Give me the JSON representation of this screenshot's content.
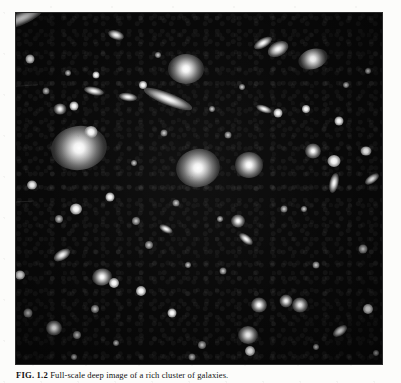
{
  "page": {
    "background_color": "#fcfcfa"
  },
  "figure": {
    "plate_background_color": "#090909",
    "alt_description": "Deep-field astronomical photograph of a rich cluster of galaxies against a black sky, showing numerous elliptical and spiral galaxies of varying brightness.",
    "caption": {
      "label": "FIG. 1.2",
      "separator": "  ",
      "text": "Full-scale deep image of a rich cluster of galaxies."
    }
  },
  "objects": [
    {
      "name": "edge-on-spiral-top-left",
      "x": 6,
      "y": 5,
      "w": 46,
      "h": 13,
      "rot": -24,
      "kind": "g-spiral"
    },
    {
      "name": "galaxy-small-upper-left",
      "x": 14,
      "y": 46,
      "w": 9,
      "h": 9,
      "rot": 0,
      "kind": "g-core"
    },
    {
      "name": "galaxy-faint-ul-1",
      "x": 30,
      "y": 78,
      "w": 7,
      "h": 7,
      "rot": 0,
      "kind": "g-faint"
    },
    {
      "name": "galaxy-disk-top-mid",
      "x": 100,
      "y": 22,
      "w": 16,
      "h": 9,
      "rot": 18,
      "kind": "g-spiral"
    },
    {
      "name": "galaxy-point-top-mid",
      "x": 80,
      "y": 62,
      "w": 7,
      "h": 7,
      "rot": 0,
      "kind": "g-core"
    },
    {
      "name": "galaxy-bright-top-right",
      "x": 170,
      "y": 56,
      "w": 36,
      "h": 30,
      "rot": 0,
      "kind": "g-ell"
    },
    {
      "name": "galaxy-jet-top-right",
      "x": 152,
      "y": 86,
      "w": 52,
      "h": 12,
      "rot": 22,
      "kind": "g-spiral"
    },
    {
      "name": "galaxy-pair-left-top",
      "x": 44,
      "y": 96,
      "w": 13,
      "h": 11,
      "rot": 0,
      "kind": "g-ell"
    },
    {
      "name": "galaxy-pair-left-top-b",
      "x": 58,
      "y": 93,
      "w": 9,
      "h": 9,
      "rot": 0,
      "kind": "g-core"
    },
    {
      "name": "galaxy-giant-left",
      "x": 63,
      "y": 135,
      "w": 56,
      "h": 44,
      "rot": -8,
      "kind": "g-ell"
    },
    {
      "name": "galaxy-companion-left",
      "x": 75,
      "y": 119,
      "w": 13,
      "h": 12,
      "rot": 0,
      "kind": "g-core"
    },
    {
      "name": "galaxy-center-dominant",
      "x": 182,
      "y": 155,
      "w": 44,
      "h": 38,
      "rot": -12,
      "kind": "g-ell"
    },
    {
      "name": "galaxy-disk-mid-left",
      "x": 78,
      "y": 78,
      "w": 20,
      "h": 8,
      "rot": 12,
      "kind": "g-spiral"
    },
    {
      "name": "galaxy-disk-mid-left-b",
      "x": 112,
      "y": 84,
      "w": 18,
      "h": 8,
      "rot": 8,
      "kind": "g-spiral"
    },
    {
      "name": "galaxy-point-mid-1",
      "x": 127,
      "y": 72,
      "w": 8,
      "h": 8,
      "rot": 0,
      "kind": "g-core"
    },
    {
      "name": "galaxy-point-mid-2",
      "x": 148,
      "y": 120,
      "w": 7,
      "h": 7,
      "rot": 0,
      "kind": "g-faint"
    },
    {
      "name": "galaxy-right-bright",
      "x": 233,
      "y": 152,
      "w": 28,
      "h": 26,
      "rot": 0,
      "kind": "g-ell"
    },
    {
      "name": "galaxy-right-upper",
      "x": 262,
      "y": 36,
      "w": 22,
      "h": 14,
      "rot": -28,
      "kind": "g-spiral"
    },
    {
      "name": "galaxy-right-upper-b",
      "x": 297,
      "y": 46,
      "w": 30,
      "h": 20,
      "rot": -18,
      "kind": "g-ell"
    },
    {
      "name": "galaxy-right-edge-on",
      "x": 247,
      "y": 30,
      "w": 20,
      "h": 9,
      "rot": -30,
      "kind": "g-spiral"
    },
    {
      "name": "galaxy-right-mid-1",
      "x": 262,
      "y": 100,
      "w": 9,
      "h": 9,
      "rot": 0,
      "kind": "g-core"
    },
    {
      "name": "galaxy-right-mid-2",
      "x": 290,
      "y": 96,
      "w": 8,
      "h": 8,
      "rot": 0,
      "kind": "g-core"
    },
    {
      "name": "galaxy-right-mid-3",
      "x": 323,
      "y": 108,
      "w": 9,
      "h": 9,
      "rot": 0,
      "kind": "g-core"
    },
    {
      "name": "galaxy-right-disk",
      "x": 248,
      "y": 96,
      "w": 16,
      "h": 7,
      "rot": 20,
      "kind": "g-spiral"
    },
    {
      "name": "galaxy-right-lower-1",
      "x": 297,
      "y": 138,
      "w": 16,
      "h": 15,
      "rot": 0,
      "kind": "g-ell"
    },
    {
      "name": "galaxy-right-lower-2",
      "x": 318,
      "y": 148,
      "w": 13,
      "h": 12,
      "rot": 0,
      "kind": "g-core"
    },
    {
      "name": "galaxy-right-streak",
      "x": 318,
      "y": 170,
      "w": 9,
      "h": 20,
      "rot": 12,
      "kind": "g-spiral"
    },
    {
      "name": "galaxy-right-edge",
      "x": 350,
      "y": 138,
      "w": 11,
      "h": 9,
      "rot": 0,
      "kind": "g-core"
    },
    {
      "name": "galaxy-far-right-disk",
      "x": 356,
      "y": 166,
      "w": 16,
      "h": 8,
      "rot": -35,
      "kind": "g-spiral"
    },
    {
      "name": "galaxy-point-center-1",
      "x": 212,
      "y": 122,
      "w": 7,
      "h": 7,
      "rot": 0,
      "kind": "g-faint"
    },
    {
      "name": "galaxy-point-center-2",
      "x": 160,
      "y": 190,
      "w": 7,
      "h": 7,
      "rot": 0,
      "kind": "g-faint"
    },
    {
      "name": "galaxy-left-lower-1",
      "x": 16,
      "y": 172,
      "w": 10,
      "h": 9,
      "rot": 0,
      "kind": "g-core"
    },
    {
      "name": "galaxy-left-lower-2",
      "x": 43,
      "y": 206,
      "w": 8,
      "h": 8,
      "rot": 0,
      "kind": "g-faint"
    },
    {
      "name": "galaxy-lower-left-disk",
      "x": 46,
      "y": 242,
      "w": 18,
      "h": 10,
      "rot": -32,
      "kind": "g-spiral"
    },
    {
      "name": "galaxy-lower-mid-bright",
      "x": 86,
      "y": 264,
      "w": 20,
      "h": 17,
      "rot": -14,
      "kind": "g-ell"
    },
    {
      "name": "galaxy-lower-mid-core",
      "x": 98,
      "y": 270,
      "w": 10,
      "h": 10,
      "rot": 0,
      "kind": "g-core"
    },
    {
      "name": "galaxy-lower-point-1",
      "x": 60,
      "y": 196,
      "w": 12,
      "h": 11,
      "rot": 0,
      "kind": "g-core"
    },
    {
      "name": "galaxy-lower-point-2",
      "x": 94,
      "y": 184,
      "w": 9,
      "h": 9,
      "rot": 0,
      "kind": "g-core"
    },
    {
      "name": "galaxy-lower-point-3",
      "x": 120,
      "y": 208,
      "w": 8,
      "h": 8,
      "rot": 0,
      "kind": "g-faint"
    },
    {
      "name": "galaxy-lower-point-4",
      "x": 133,
      "y": 232,
      "w": 8,
      "h": 8,
      "rot": 0,
      "kind": "g-faint"
    },
    {
      "name": "galaxy-lower-point-5",
      "x": 125,
      "y": 278,
      "w": 10,
      "h": 10,
      "rot": 0,
      "kind": "g-core"
    },
    {
      "name": "galaxy-lower-point-6",
      "x": 79,
      "y": 296,
      "w": 8,
      "h": 8,
      "rot": 0,
      "kind": "g-faint"
    },
    {
      "name": "galaxy-bottom-left-bright",
      "x": 38,
      "y": 315,
      "w": 16,
      "h": 15,
      "rot": 0,
      "kind": "g-ell"
    },
    {
      "name": "galaxy-bottom-left-2",
      "x": 61,
      "y": 322,
      "w": 8,
      "h": 8,
      "rot": 0,
      "kind": "g-faint"
    },
    {
      "name": "galaxy-bottom-left-3",
      "x": 4,
      "y": 262,
      "w": 10,
      "h": 9,
      "rot": 0,
      "kind": "g-core"
    },
    {
      "name": "galaxy-left-disk-2",
      "x": 12,
      "y": 300,
      "w": 9,
      "h": 9,
      "rot": 0,
      "kind": "g-faint"
    },
    {
      "name": "galaxy-mid-lower-disk",
      "x": 150,
      "y": 216,
      "w": 14,
      "h": 7,
      "rot": 26,
      "kind": "g-spiral"
    },
    {
      "name": "galaxy-mid-bottom-1",
      "x": 156,
      "y": 300,
      "w": 9,
      "h": 9,
      "rot": 0,
      "kind": "g-core"
    },
    {
      "name": "galaxy-mid-bottom-2",
      "x": 186,
      "y": 332,
      "w": 8,
      "h": 8,
      "rot": 0,
      "kind": "g-faint"
    },
    {
      "name": "galaxy-right-bottom-disk",
      "x": 230,
      "y": 226,
      "w": 16,
      "h": 8,
      "rot": 38,
      "kind": "g-spiral"
    },
    {
      "name": "galaxy-right-bottom-1",
      "x": 222,
      "y": 208,
      "w": 14,
      "h": 13,
      "rot": 0,
      "kind": "g-ell"
    },
    {
      "name": "galaxy-right-bottom-2",
      "x": 243,
      "y": 292,
      "w": 16,
      "h": 15,
      "rot": 0,
      "kind": "g-ell"
    },
    {
      "name": "galaxy-right-bottom-pair-a",
      "x": 270,
      "y": 288,
      "w": 13,
      "h": 13,
      "rot": 0,
      "kind": "g-ell"
    },
    {
      "name": "galaxy-right-bottom-pair-b",
      "x": 284,
      "y": 292,
      "w": 16,
      "h": 15,
      "rot": 0,
      "kind": "g-ell"
    },
    {
      "name": "galaxy-bottom-mid-bright",
      "x": 232,
      "y": 322,
      "w": 20,
      "h": 18,
      "rot": 0,
      "kind": "g-ell"
    },
    {
      "name": "galaxy-bottom-mid-core",
      "x": 234,
      "y": 338,
      "w": 10,
      "h": 10,
      "rot": 0,
      "kind": "g-core"
    },
    {
      "name": "galaxy-bottom-right-disk",
      "x": 324,
      "y": 318,
      "w": 16,
      "h": 9,
      "rot": -35,
      "kind": "g-spiral"
    },
    {
      "name": "galaxy-bottom-right-2",
      "x": 352,
      "y": 296,
      "w": 10,
      "h": 10,
      "rot": 0,
      "kind": "g-core"
    },
    {
      "name": "galaxy-right-far-1",
      "x": 347,
      "y": 236,
      "w": 9,
      "h": 9,
      "rot": 0,
      "kind": "g-faint"
    },
    {
      "name": "galaxy-right-far-2",
      "x": 300,
      "y": 252,
      "w": 7,
      "h": 7,
      "rot": 0,
      "kind": "g-faint"
    },
    {
      "name": "galaxy-right-far-3",
      "x": 268,
      "y": 196,
      "w": 7,
      "h": 7,
      "rot": 0,
      "kind": "g-faint"
    },
    {
      "name": "galaxy-right-far-4",
      "x": 207,
      "y": 258,
      "w": 7,
      "h": 7,
      "rot": 0,
      "kind": "g-faint"
    },
    {
      "name": "galaxy-center-faint-1",
      "x": 172,
      "y": 252,
      "w": 6,
      "h": 6,
      "rot": 0,
      "kind": "g-faint"
    },
    {
      "name": "galaxy-center-faint-2",
      "x": 196,
      "y": 96,
      "w": 6,
      "h": 6,
      "rot": 0,
      "kind": "g-faint"
    },
    {
      "name": "galaxy-center-faint-3",
      "x": 226,
      "y": 74,
      "w": 6,
      "h": 6,
      "rot": 0,
      "kind": "g-faint"
    },
    {
      "name": "galaxy-center-faint-4",
      "x": 118,
      "y": 150,
      "w": 6,
      "h": 6,
      "rot": 0,
      "kind": "g-faint"
    },
    {
      "name": "galaxy-center-faint-5",
      "x": 142,
      "y": 42,
      "w": 6,
      "h": 6,
      "rot": 0,
      "kind": "g-faint"
    },
    {
      "name": "galaxy-center-faint-6",
      "x": 52,
      "y": 60,
      "w": 6,
      "h": 6,
      "rot": 0,
      "kind": "g-faint"
    },
    {
      "name": "galaxy-center-faint-7",
      "x": 288,
      "y": 196,
      "w": 6,
      "h": 6,
      "rot": 0,
      "kind": "g-faint"
    },
    {
      "name": "galaxy-center-faint-8",
      "x": 330,
      "y": 72,
      "w": 6,
      "h": 6,
      "rot": 0,
      "kind": "g-faint"
    },
    {
      "name": "galaxy-center-faint-9",
      "x": 352,
      "y": 58,
      "w": 6,
      "h": 6,
      "rot": 0,
      "kind": "g-faint"
    },
    {
      "name": "galaxy-center-faint-10",
      "x": 204,
      "y": 206,
      "w": 6,
      "h": 6,
      "rot": 0,
      "kind": "g-faint"
    },
    {
      "name": "galaxy-center-faint-11",
      "x": 100,
      "y": 330,
      "w": 6,
      "h": 6,
      "rot": 0,
      "kind": "g-faint"
    },
    {
      "name": "galaxy-center-faint-12",
      "x": 300,
      "y": 334,
      "w": 6,
      "h": 6,
      "rot": 0,
      "kind": "g-faint"
    },
    {
      "name": "galaxy-center-faint-13",
      "x": 176,
      "y": 344,
      "w": 7,
      "h": 7,
      "rot": 0,
      "kind": "g-faint"
    },
    {
      "name": "galaxy-center-faint-14",
      "x": 58,
      "y": 344,
      "w": 6,
      "h": 6,
      "rot": 0,
      "kind": "g-faint"
    },
    {
      "name": "galaxy-center-faint-15",
      "x": 360,
      "y": 340,
      "w": 6,
      "h": 6,
      "rot": 0,
      "kind": "g-faint"
    }
  ],
  "streaks": [
    {
      "name": "scan-streak-upper-left",
      "x": 0,
      "y": 72,
      "w": 22,
      "h": 1,
      "rot": -4
    },
    {
      "name": "scan-streak-left",
      "x": 0,
      "y": 188,
      "w": 18,
      "h": 1,
      "rot": -3
    }
  ]
}
